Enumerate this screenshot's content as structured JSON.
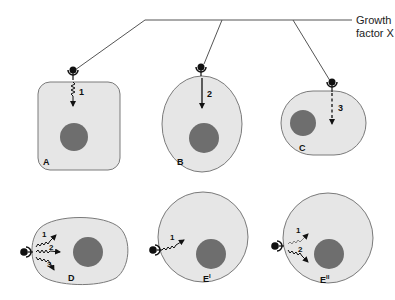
{
  "diagram": {
    "ligand_label_line1": "Growth",
    "ligand_label_line2": "factor X",
    "colors": {
      "cell_fill": "#e6e6e6",
      "cell_outline": "#7a7a7a",
      "nucleus": "#6e6e6e",
      "line": "#555555",
      "receptor": "#111111"
    },
    "cells": [
      {
        "id": "A",
        "label": "A",
        "shape": "rounded-rectangle",
        "pathways": [
          {
            "num": "1",
            "style": "wavy"
          }
        ]
      },
      {
        "id": "B",
        "label": "B",
        "shape": "ellipse",
        "pathways": [
          {
            "num": "2",
            "style": "straight"
          }
        ]
      },
      {
        "id": "C",
        "label": "C",
        "shape": "stadium",
        "pathways": [
          {
            "num": "3",
            "style": "dashed"
          }
        ]
      },
      {
        "id": "D",
        "label": "D",
        "shape": "oval",
        "pathways": [
          {
            "num": "1",
            "style": "wavy"
          },
          {
            "num": "2",
            "style": "wavy"
          },
          {
            "num": "3",
            "style": "wavy"
          }
        ]
      },
      {
        "id": "E1",
        "label": "E",
        "sup": "I",
        "shape": "circle",
        "pathways": [
          {
            "num": "1",
            "style": "wavy"
          }
        ]
      },
      {
        "id": "E2",
        "label": "E",
        "sup": "II",
        "shape": "circle",
        "pathways": [
          {
            "num": "1",
            "style": "wavy-faint"
          },
          {
            "num": "2",
            "style": "wavy"
          }
        ]
      }
    ]
  }
}
